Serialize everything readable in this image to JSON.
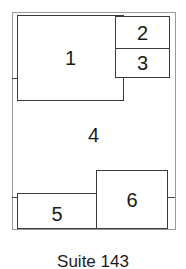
{
  "diagram": {
    "type": "floor-plan",
    "caption": "Suite 143",
    "rooms": [
      {
        "id": "1",
        "label": "1"
      },
      {
        "id": "2",
        "label": "2"
      },
      {
        "id": "3",
        "label": "3"
      },
      {
        "id": "4",
        "label": "4"
      },
      {
        "id": "5",
        "label": "5"
      },
      {
        "id": "6",
        "label": "6"
      }
    ]
  }
}
